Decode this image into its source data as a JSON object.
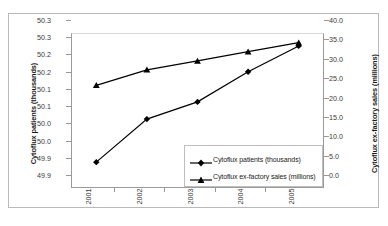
{
  "chart_data": {
    "type": "line",
    "title": "",
    "xlabel": "",
    "categories": [
      "2001",
      "2002",
      "2003",
      "2004",
      "2005"
    ],
    "grid": false,
    "legend_position": "inside-lower-right",
    "series": [
      {
        "name": "Cytoflux patients (thousands)",
        "axis": "left",
        "marker": "diamond",
        "color": "#000000",
        "values": [
          50.0,
          50.1,
          50.14,
          50.21,
          50.27
        ]
      },
      {
        "name": "Cytoflux ex-factory sales (millions)",
        "axis": "right",
        "marker": "triangle",
        "color": "#000000",
        "values": [
          26.5,
          30.5,
          32.8,
          35.2,
          37.5
        ]
      }
    ],
    "y_left": {
      "label": "Cytoflux patients (thousands)",
      "ylim": [
        49.94,
        50.3
      ],
      "tick_labels": [
        "50.3",
        "50.3",
        "50.2",
        "50.2",
        "50.1",
        "50.1",
        "50.0",
        "50.0",
        "49.9",
        "49.9"
      ],
      "tick_values": [
        50.3,
        50.26,
        50.22,
        50.18,
        50.14,
        50.1,
        50.06,
        50.02,
        49.98,
        49.94
      ]
    },
    "y_right": {
      "label": "Cytoflux ex-factory sales (millions)",
      "ylim": [
        0.0,
        40.0
      ],
      "tick_labels": [
        "40.0",
        "35.0",
        "30.0",
        "25.0",
        "20.0",
        "15.0",
        "10.0",
        "5.0",
        "0.0"
      ],
      "tick_values": [
        40.0,
        35.0,
        30.0,
        25.0,
        20.0,
        15.0,
        10.0,
        5.0,
        0.0
      ]
    },
    "legend": [
      {
        "label": "Cytoflux patients (thousands)",
        "marker": "diamond"
      },
      {
        "label": "Cytoflux ex-factory sales (millions)",
        "marker": "triangle"
      }
    ]
  }
}
